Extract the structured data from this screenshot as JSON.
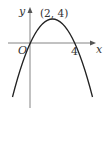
{
  "diagram": {
    "title": "",
    "curve": "parabola y = 4x - x^2 (opening downward)",
    "labels": {
      "y_axis": "y",
      "x_axis": "x",
      "origin": "O",
      "vertex": "(2, 4)",
      "root": "4"
    },
    "points": {
      "origin": [
        0,
        0
      ],
      "vertex": [
        2,
        4
      ],
      "root": [
        4,
        0
      ]
    },
    "colors": {
      "curve": "#222222",
      "axis": "#666666",
      "text": "#333333"
    }
  }
}
